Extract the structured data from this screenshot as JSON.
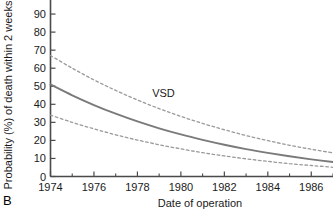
{
  "panel": {
    "label": "B"
  },
  "chart_data": {
    "type": "line",
    "title": "",
    "subtitle": "",
    "xlabel": "Date of operation",
    "ylabel": "Probability (%) of death within 2 weeks",
    "xlim": [
      1974,
      1987
    ],
    "ylim": [
      0,
      100
    ],
    "grid": false,
    "legend": "none",
    "xticks": [
      1974,
      1976,
      1978,
      1980,
      1982,
      1984,
      1986
    ],
    "xticks_minor": [
      1975,
      1977,
      1979,
      1981,
      1983,
      1985,
      1987
    ],
    "yticks": [
      0,
      10,
      20,
      30,
      40,
      50,
      60,
      70,
      80,
      90,
      100
    ],
    "ytick_labels": [
      "0",
      "10",
      "20",
      "30",
      "40",
      "50",
      "60",
      "70",
      "80",
      "90",
      "100"
    ],
    "annotations": [
      {
        "text": "VSD",
        "x": 1979.2,
        "y": 44
      }
    ],
    "x": [
      1974,
      1975,
      1976,
      1977,
      1978,
      1979,
      1980,
      1981,
      1982,
      1983,
      1984,
      1985,
      1986,
      1987
    ],
    "series": [
      {
        "name": "VSD fitted probability",
        "style": "solid",
        "color": "#7a7a7a",
        "values": [
          51.0,
          45.0,
          39.6,
          34.8,
          30.5,
          26.7,
          23.3,
          20.3,
          17.6,
          15.2,
          13.1,
          11.2,
          9.5,
          8.0
        ]
      },
      {
        "name": "Upper 95% confidence limit",
        "style": "dashed",
        "color": "#9a9a9a",
        "values": [
          67.0,
          60.0,
          53.5,
          47.7,
          42.4,
          37.6,
          33.3,
          29.4,
          25.9,
          22.7,
          19.9,
          17.3,
          15.1,
          13.1
        ]
      },
      {
        "name": "Lower 95% confidence limit",
        "style": "dashed",
        "color": "#9a9a9a",
        "values": [
          34.0,
          30.0,
          26.4,
          23.1,
          20.2,
          17.6,
          15.3,
          13.2,
          11.4,
          9.8,
          8.4,
          7.1,
          6.1,
          5.1
        ]
      }
    ]
  }
}
